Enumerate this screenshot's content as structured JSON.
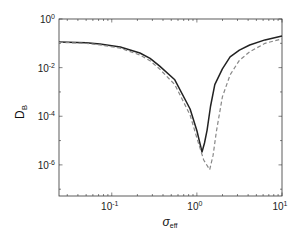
{
  "chart_data": {
    "type": "line",
    "title": "",
    "xlabel": "σ",
    "xlabel_sub": "eff",
    "ylabel": "D",
    "ylabel_sub": "B",
    "xscale": "log",
    "yscale": "log",
    "xlim_log10": [
      -1.62,
      1.0
    ],
    "ylim_log10": [
      -7.28,
      0
    ],
    "x_ticks": [
      {
        "base": "10",
        "exp": "-1",
        "log10": -1
      },
      {
        "base": "10",
        "exp": "0",
        "log10": 0
      },
      {
        "base": "10",
        "exp": "1",
        "log10": 1
      }
    ],
    "y_ticks": [
      {
        "base": "10",
        "exp": "0",
        "log10": 0
      },
      {
        "base": "10",
        "exp": "-2",
        "log10": -2
      },
      {
        "base": "10",
        "exp": "-4",
        "log10": -4
      },
      {
        "base": "10",
        "exp": "-6",
        "log10": -6
      }
    ],
    "grid": false,
    "legend": null,
    "series": [
      {
        "name": "solid",
        "style": "solid",
        "color": "#222222",
        "log10_x": [
          -1.62,
          -1.3,
          -1.14,
          -0.9,
          -0.67,
          -0.55,
          -0.44,
          -0.26,
          -0.08,
          0.0,
          0.06,
          0.09,
          0.12,
          0.16,
          0.21,
          0.3,
          0.39,
          0.5,
          0.62,
          0.8,
          1.0
        ],
        "log10_y": [
          -0.95,
          -0.98,
          -1.03,
          -1.15,
          -1.4,
          -1.62,
          -1.93,
          -2.5,
          -3.7,
          -4.6,
          -5.47,
          -5.1,
          -4.57,
          -3.6,
          -2.7,
          -2.05,
          -1.56,
          -1.28,
          -1.07,
          -0.86,
          -0.7
        ]
      },
      {
        "name": "dashed",
        "style": "dashed",
        "color": "#888888",
        "log10_x": [
          -1.62,
          -1.3,
          -1.14,
          -0.9,
          -0.67,
          -0.55,
          -0.44,
          -0.26,
          -0.08,
          0.0,
          0.08,
          0.15,
          0.19,
          0.23,
          0.3,
          0.39,
          0.5,
          0.62,
          0.8,
          1.0
        ],
        "log10_y": [
          -0.96,
          -1.0,
          -1.06,
          -1.2,
          -1.48,
          -1.72,
          -2.05,
          -2.7,
          -3.95,
          -4.9,
          -5.8,
          -6.2,
          -5.6,
          -4.6,
          -3.2,
          -2.3,
          -1.7,
          -1.35,
          -1.0,
          -0.82
        ]
      }
    ]
  }
}
